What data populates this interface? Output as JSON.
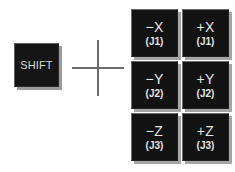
{
  "diagram": {
    "background_color": "#ffffff",
    "key_color": "#121212",
    "key_text_color": "#e6e6e6",
    "shadow_color": "#a5a5a5",
    "separator_color": "#6b6b6b"
  },
  "shift_key": {
    "label": "SHIFT"
  },
  "separator": {
    "symbol": "plus-sign"
  },
  "keypad": {
    "rows": [
      {
        "keys": [
          {
            "axis": "−X",
            "joint": "(J1)"
          },
          {
            "axis": "+X",
            "joint": "(J1)"
          }
        ]
      },
      {
        "keys": [
          {
            "axis": "−Y",
            "joint": "(J2)"
          },
          {
            "axis": "+Y",
            "joint": "(J2)"
          }
        ]
      },
      {
        "keys": [
          {
            "axis": "−Z",
            "joint": "(J3)"
          },
          {
            "axis": "+Z",
            "joint": "(J3)"
          }
        ]
      }
    ]
  }
}
